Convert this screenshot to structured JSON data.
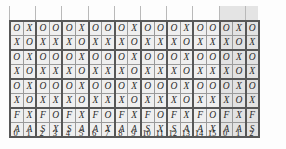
{
  "figure": {
    "title": "",
    "columns": 19,
    "rows": 8,
    "shaded_columns": [
      16,
      17,
      18
    ],
    "colors": {
      "cell_fill": "#efefef",
      "cell_fill_shaded": "#e2e2e2",
      "cell_border": "#9a9a9a",
      "group_border": "#575757",
      "tick": "#b9b9b9",
      "text": "#2b2b2b",
      "background": "#fdfdfd"
    }
  },
  "grid": {
    "rows": [
      [
        "O",
        "X",
        "O",
        "O",
        "O",
        "X",
        "O",
        "O",
        "O",
        "X",
        "O",
        "O",
        "O",
        "X",
        "O",
        "O",
        "O",
        "X",
        "O"
      ],
      [
        "X",
        "O",
        "X",
        "X",
        "X",
        "O",
        "X",
        "X",
        "X",
        "O",
        "X",
        "X",
        "X",
        "O",
        "X",
        "X",
        "X",
        "O",
        "X"
      ],
      [
        "O",
        "X",
        "O",
        "O",
        "O",
        "X",
        "O",
        "O",
        "O",
        "X",
        "O",
        "O",
        "O",
        "X",
        "O",
        "O",
        "O",
        "X",
        "O"
      ],
      [
        "X",
        "O",
        "X",
        "X",
        "X",
        "O",
        "X",
        "X",
        "X",
        "O",
        "X",
        "X",
        "X",
        "O",
        "X",
        "X",
        "X",
        "O",
        "X"
      ],
      [
        "O",
        "X",
        "O",
        "O",
        "O",
        "X",
        "O",
        "O",
        "O",
        "X",
        "O",
        "O",
        "O",
        "X",
        "O",
        "O",
        "O",
        "X",
        "O"
      ],
      [
        "X",
        "O",
        "X",
        "X",
        "X",
        "O",
        "X",
        "X",
        "X",
        "O",
        "X",
        "X",
        "X",
        "O",
        "X",
        "X",
        "X",
        "O",
        "X"
      ],
      [
        "F",
        "X",
        "F",
        "O",
        "F",
        "X",
        "F",
        "O",
        "F",
        "X",
        "F",
        "O",
        "F",
        "X",
        "F",
        "O",
        "F",
        "X",
        "F"
      ],
      [
        "A",
        "A",
        "S",
        "X",
        "S",
        "A",
        "A",
        "X",
        "A",
        "A",
        "S",
        "X",
        "S",
        "A",
        "A",
        "X",
        "A",
        "A",
        "S"
      ]
    ]
  },
  "axis": {
    "labels": [
      "0",
      "1",
      "2",
      "3",
      "4",
      "5",
      "6",
      "7",
      "8",
      "9",
      "10",
      "11",
      "12",
      "13",
      "14",
      "15",
      "0",
      "1",
      "2"
    ]
  }
}
